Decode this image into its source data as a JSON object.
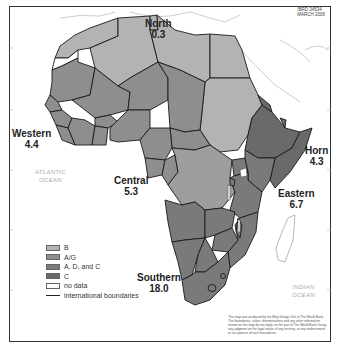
{
  "map": {
    "id_label": "IBRD 34534",
    "date_label": "MARCH 2006",
    "colors": {
      "B": "#b3b3b3",
      "A/G": "#8e8e8e",
      "A, D, and C": "#7a7a7a",
      "C": "#6a6a6a",
      "no_data": "#ffffff",
      "boundary": "#1a1a1a"
    },
    "regions": [
      {
        "name": "North",
        "value": "0.3"
      },
      {
        "name": "Western",
        "value": "4.4"
      },
      {
        "name": "Central",
        "value": "5.3"
      },
      {
        "name": "Horn",
        "value": "4.3"
      },
      {
        "name": "Eastern",
        "value": "6.7"
      },
      {
        "name": "Southern",
        "value": "18.0"
      }
    ],
    "oceans": [
      {
        "line1": "ATLANTIC",
        "line2": "OCEAN"
      },
      {
        "line1": "INDIAN",
        "line2": "OCEAN"
      }
    ],
    "legend": [
      {
        "label": "B"
      },
      {
        "label": "A/G"
      },
      {
        "label": "A, D, and C"
      },
      {
        "label": "C"
      },
      {
        "label": "no data"
      },
      {
        "label": "international boundaries"
      }
    ],
    "disclaimer": "This map was produced by the Map Design Unit of The World Bank. The boundaries, colors, denominations and any other information shown on this map do not imply, on the part of The World Bank Group, any judgment on the legal status of any territory, or any endorsement or acceptance of such boundaries."
  }
}
